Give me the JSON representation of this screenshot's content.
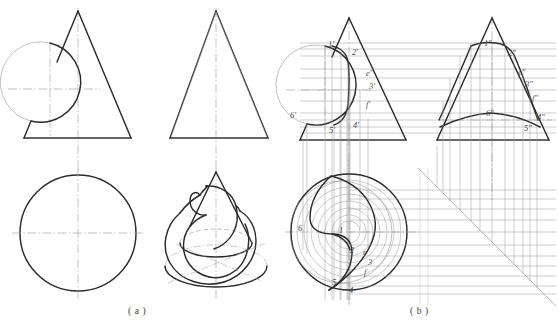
{
  "figure": {
    "captions": [
      {
        "id": "a",
        "text": "( a )",
        "x": 128,
        "y": 312
      },
      {
        "id": "b",
        "text": "( b )",
        "x": 410,
        "y": 312
      }
    ],
    "ghost_header": "",
    "colors": {
      "visible_line": "#2b2b2b",
      "hidden_line": "#9a9a9a",
      "center_line": "#9a9a9a",
      "projection_line": "#9b9b9b",
      "construction_line": "#a2a2a2",
      "paper": "#ffffff",
      "label_text": "#4a4a4a"
    }
  },
  "panel_a": {
    "name": "problem-setup",
    "views": [
      {
        "name": "front-view-cone-cylinder",
        "type": "triangle-with-circle"
      },
      {
        "name": "side-view-cone",
        "type": "triangle"
      },
      {
        "name": "top-view-cone",
        "type": "circle"
      },
      {
        "name": "pictorial-view",
        "type": "axonometric"
      }
    ]
  },
  "panel_b": {
    "name": "solution-construction",
    "views": [
      {
        "name": "front-view-with-points",
        "type": "triangle-with-circle"
      },
      {
        "name": "side-view-with-points",
        "type": "triangle-with-curve"
      },
      {
        "name": "top-view-with-aux-circles",
        "type": "circles"
      },
      {
        "name": "miter-line-45",
        "type": "construction"
      }
    ],
    "labels_front": [
      {
        "text": "1'",
        "x": 330,
        "y": 45
      },
      {
        "text": "2'",
        "x": 354,
        "y": 53
      },
      {
        "text": "e'",
        "x": 368,
        "y": 74
      },
      {
        "text": "3'",
        "x": 371,
        "y": 87
      },
      {
        "text": "f'",
        "x": 368,
        "y": 105
      },
      {
        "text": "6'",
        "x": 292,
        "y": 116
      },
      {
        "text": "5'",
        "x": 331,
        "y": 131
      },
      {
        "text": "4'",
        "x": 355,
        "y": 126
      }
    ],
    "labels_side": [
      {
        "text": "1\"",
        "x": 486,
        "y": 44
      },
      {
        "text": "2\"",
        "x": 510,
        "y": 54
      },
      {
        "text": "e\"",
        "x": 520,
        "y": 73
      },
      {
        "text": "3\"",
        "x": 527,
        "y": 85
      },
      {
        "text": "f\"",
        "x": 534,
        "y": 99
      },
      {
        "text": "6\"",
        "x": 488,
        "y": 114
      },
      {
        "text": "4\"",
        "x": 539,
        "y": 118
      },
      {
        "text": "5\"",
        "x": 526,
        "y": 129
      }
    ],
    "labels_top": [
      {
        "text": "6",
        "x": 300,
        "y": 228
      },
      {
        "text": "1",
        "x": 341,
        "y": 230
      },
      {
        "text": "2",
        "x": 352,
        "y": 250
      },
      {
        "text": "e",
        "x": 365,
        "y": 252
      },
      {
        "text": "3",
        "x": 370,
        "y": 262
      },
      {
        "text": "f",
        "x": 366,
        "y": 272
      },
      {
        "text": "5",
        "x": 334,
        "y": 282
      },
      {
        "text": "4",
        "x": 351,
        "y": 290
      }
    ]
  }
}
